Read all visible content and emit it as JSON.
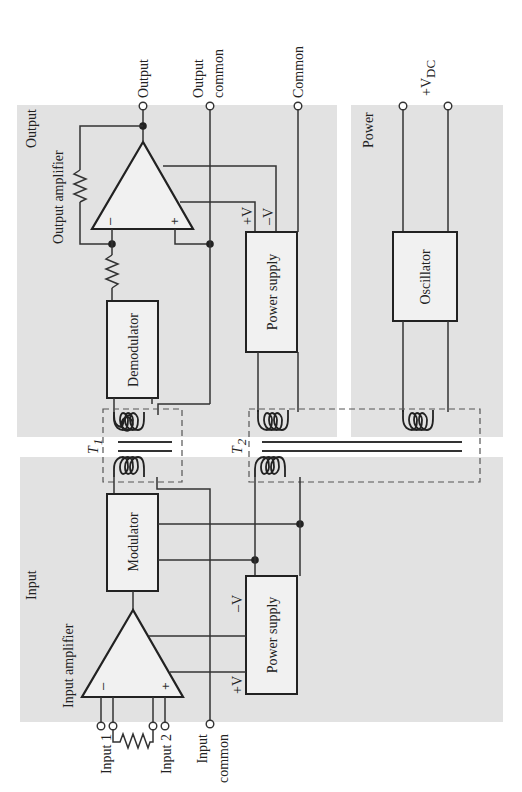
{
  "sections": {
    "output": "Output",
    "input": "Input",
    "power": "Power"
  },
  "blocks": {
    "output_amplifier": "Output amplifier",
    "input_amplifier": "Input amplifier",
    "demodulator": "Demodulator",
    "modulator": "Modulator",
    "output_power_supply": "Power supply",
    "input_power_supply": "Power supply",
    "oscillator": "Oscillator"
  },
  "transformers": {
    "t1": "T",
    "t1_sub": "1",
    "t2": "T",
    "t2_sub": "2"
  },
  "terminals": {
    "output": "Output",
    "output_common_1": "Output",
    "output_common_2": "common",
    "common": "Common",
    "vdc_prefix": "+V",
    "vdc_sub": "DC",
    "input1": "Input 1",
    "input2": "Input 2",
    "input_common_1": "Input",
    "input_common_2": "common"
  },
  "rails": {
    "plus_v": "+V",
    "minus_v": "–V"
  },
  "amp_signs": {
    "minus": "–",
    "plus": "+"
  }
}
